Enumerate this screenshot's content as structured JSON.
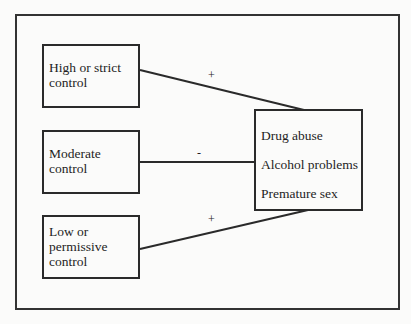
{
  "diagram": {
    "type": "path-model",
    "sources": [
      {
        "id": "high",
        "label": "High or strict control"
      },
      {
        "id": "moderate",
        "label": "Moderate control"
      },
      {
        "id": "low",
        "label": "Low or permissive control"
      }
    ],
    "target": {
      "items": [
        "Drug abuse",
        "Alcohol problems",
        "Premature sex"
      ]
    },
    "links": [
      {
        "from": "high",
        "to": "target",
        "sign": "+"
      },
      {
        "from": "moderate",
        "to": "target",
        "sign": "-"
      },
      {
        "from": "low",
        "to": "target",
        "sign": "+"
      }
    ],
    "colors": {
      "line": "#2a2a2a",
      "background": "#fbfbfa"
    }
  }
}
